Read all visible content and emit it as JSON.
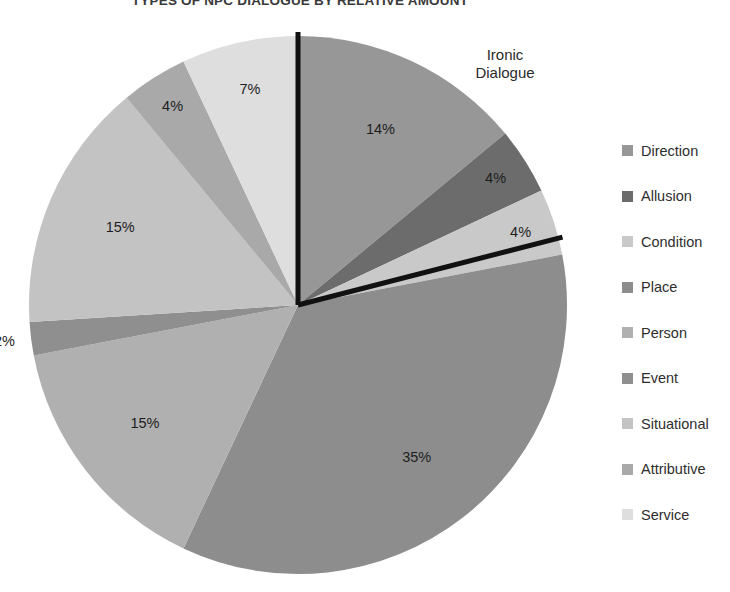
{
  "chart_data": {
    "type": "pie",
    "title": "TYPES OF NPC DIALOGUE BY RELATIVE AMOUNT",
    "xlabel": "",
    "ylabel": "",
    "legend_position": "right",
    "grid": false,
    "start_angle_deg": 0,
    "direction": "clockwise",
    "categories": [
      "Direction",
      "Allusion",
      "Condition",
      "Place",
      "Person",
      "Event",
      "Situational",
      "Attributive",
      "Service"
    ],
    "values": [
      14,
      4,
      4,
      35,
      15,
      2,
      15,
      4,
      7
    ],
    "labels": [
      "14%",
      "4%",
      "4%",
      "35%",
      "15%",
      "2%",
      "15%",
      "4%",
      "7%"
    ],
    "colors": [
      "#979797",
      "#6c6c6c",
      "#c9c9c9",
      "#8d8d8d",
      "#b0b0b0",
      "#8f8f8f",
      "#c3c3c3",
      "#a9a9a9",
      "#dedede"
    ],
    "annotations": [
      {
        "text_line1": "Ironic",
        "text_line2": "Dialogue",
        "x": 505,
        "y": 46
      }
    ],
    "callout_lines": [
      {
        "from": "center",
        "angle_deg": 0,
        "note": "vertical black leader at 12 o'clock"
      },
      {
        "from": "center",
        "angle_deg": 75.6,
        "note": "black leader at end of Condition slice"
      }
    ]
  },
  "legend": {
    "items": [
      {
        "label": "Direction",
        "color": "#979797"
      },
      {
        "label": "Allusion",
        "color": "#6c6c6c"
      },
      {
        "label": "Condition",
        "color": "#c9c9c9"
      },
      {
        "label": "Place",
        "color": "#8d8d8d"
      },
      {
        "label": "Person",
        "color": "#b0b0b0"
      },
      {
        "label": "Event",
        "color": "#8f8f8f"
      },
      {
        "label": "Situational",
        "color": "#c3c3c3"
      },
      {
        "label": "Attributive",
        "color": "#a9a9a9"
      },
      {
        "label": "Service",
        "color": "#dedede"
      }
    ]
  },
  "geometry": {
    "center_x": 298,
    "center_y": 305,
    "radius": 269
  }
}
